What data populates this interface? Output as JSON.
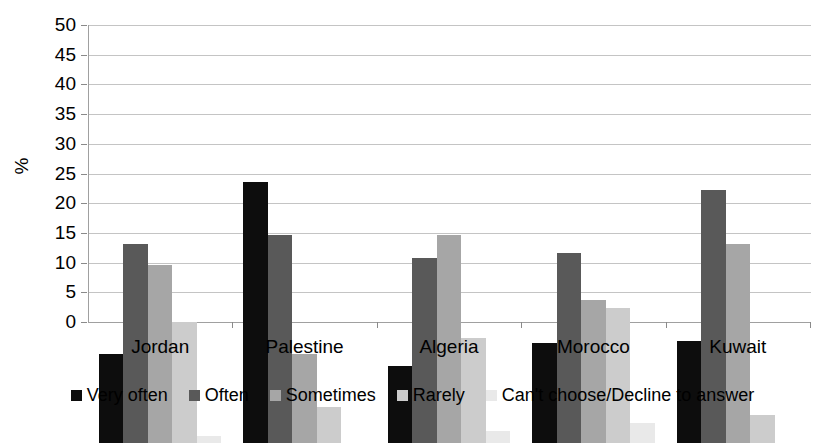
{
  "chart_data": {
    "type": "bar",
    "title": "",
    "xlabel": "",
    "ylabel": "%",
    "ylim": [
      0,
      50
    ],
    "yticks": [
      0,
      5,
      10,
      15,
      20,
      25,
      30,
      35,
      40,
      45,
      50
    ],
    "grid": true,
    "legend_position": "bottom",
    "categories": [
      "Jordan",
      "Palestine",
      "Algeria",
      "Morocco",
      "Kuwait"
    ],
    "series": [
      {
        "name": "Very often",
        "color": "#0d0d0d",
        "values": [
          15.0,
          43.9,
          13.0,
          16.8,
          17.1
        ]
      },
      {
        "name": "Often",
        "color": "#595959",
        "values": [
          33.5,
          35.0,
          31.2,
          32.0,
          42.6
        ]
      },
      {
        "name": "Sometimes",
        "color": "#a6a6a6",
        "values": [
          29.9,
          15.0,
          35.1,
          24.0,
          33.5
        ]
      },
      {
        "name": "Rarely",
        "color": "#cccccc",
        "values": [
          20.4,
          6.0,
          17.6,
          22.8,
          4.7
        ]
      },
      {
        "name": "Can't choose/Decline to answer",
        "color": "#e9e9e9",
        "values": [
          1.1,
          0.0,
          2.1,
          3.4,
          0.0
        ]
      }
    ]
  },
  "axis": {
    "y_title": "%"
  }
}
